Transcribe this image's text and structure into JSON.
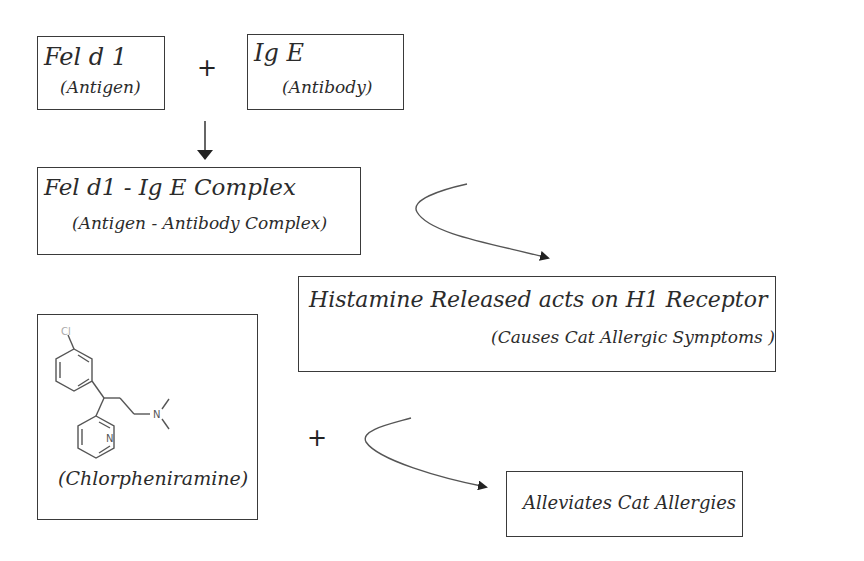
{
  "diagram": {
    "antigen": {
      "title": "Fel d 1",
      "subtitle": "(Antigen)"
    },
    "plus_1": "+",
    "antibody": {
      "title": "Ig E",
      "subtitle": "(Antibody)"
    },
    "complex": {
      "title": "Fel d1 - Ig E Complex",
      "subtitle": "(Antigen - Antibody Complex)"
    },
    "histamine": {
      "title": "Histamine Released acts on H1 Receptor",
      "subtitle": "(Causes Cat Allergic Symptoms )"
    },
    "drug": {
      "label": "(Chlorpheniramine)",
      "atoms": {
        "chlorine": "Cl",
        "pyridine_n": "N",
        "amine_n": "N"
      }
    },
    "plus_2": "+",
    "result": {
      "title": "Alleviates Cat Allergies"
    }
  },
  "colors": {
    "line": "#3a3a3a",
    "text": "#2b2b2b",
    "background": "#ffffff"
  }
}
